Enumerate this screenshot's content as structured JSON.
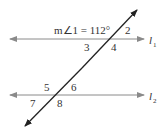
{
  "diagram": {
    "given": "m∠1 = 112°",
    "lines": {
      "l1": {
        "name": "l",
        "subscript": "1"
      },
      "l2": {
        "name": "l",
        "subscript": "2"
      }
    },
    "angles": [
      "2",
      "3",
      "4",
      "5",
      "6",
      "7",
      "8"
    ],
    "colors": {
      "parallel_lines": "#8a8a8a",
      "transversal": "#222222",
      "text": "#333333"
    }
  }
}
